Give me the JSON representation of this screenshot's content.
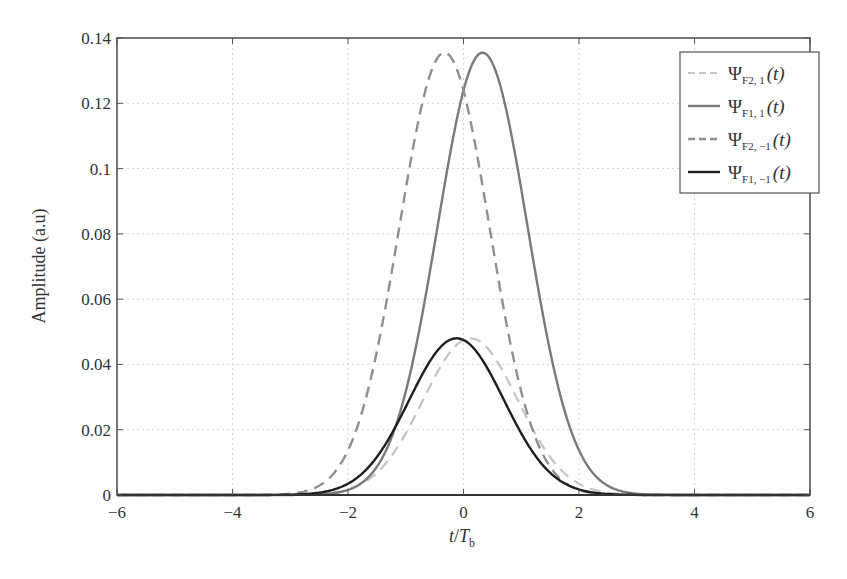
{
  "chart_data": {
    "type": "line",
    "title": "",
    "xlabel": "t/T_b",
    "xlabel_parts": {
      "t": "t",
      "slash": "/",
      "T": "T",
      "sub": "b"
    },
    "ylabel": "Amplitude (a.u)",
    "xlim": [
      -6,
      6
    ],
    "ylim": [
      0,
      0.14
    ],
    "grid": true,
    "legend_position": "upper right",
    "x_ticks": [
      -6,
      -4,
      -2,
      0,
      2,
      4,
      6
    ],
    "x_tick_labels": [
      "−6",
      "−4",
      "−2",
      "0",
      "2",
      "4",
      "6"
    ],
    "y_ticks": [
      0,
      0.02,
      0.04,
      0.06,
      0.08,
      0.1,
      0.12,
      0.14
    ],
    "y_tick_labels": [
      "0",
      "0.02",
      "0.04",
      "0.06",
      "0.08",
      "0.1",
      "0.12",
      "0.14"
    ],
    "series": [
      {
        "name": "ΨF2,1(t)",
        "label_main": "Ψ",
        "label_sub": "F2, 1",
        "label_arg": "(t)",
        "style": "dashed",
        "color": "#c4c4c4",
        "width": 2.2,
        "shape": {
          "peak": 0.048,
          "center": 0.12,
          "sigma": 0.82
        },
        "x": [
          -6,
          -4,
          -3,
          -2,
          -1.5,
          -1,
          -0.5,
          0,
          0.12,
          0.5,
          1,
          1.5,
          2,
          3,
          4,
          6
        ],
        "values": [
          0,
          0,
          0.0007,
          0.0045,
          0.011,
          0.0211,
          0.0335,
          0.0449,
          0.048,
          0.043,
          0.0301,
          0.0162,
          0.0069,
          0.0005,
          0,
          0
        ]
      },
      {
        "name": "ΨF1,1(t)",
        "label_main": "Ψ",
        "label_sub": "F1, 1",
        "label_arg": "(t)",
        "style": "solid",
        "color": "#7a7a7a",
        "width": 2.4,
        "shape": {
          "peak": 0.1355,
          "center": 0.33,
          "sigma": 0.78
        },
        "x": [
          -6,
          -4,
          -3,
          -2,
          -1.5,
          -1,
          -0.5,
          0,
          0.33,
          0.5,
          1,
          1.5,
          2,
          2.5,
          3,
          4,
          6
        ],
        "values": [
          0,
          0,
          0.0003,
          0.0055,
          0.0158,
          0.0317,
          0.075,
          0.124,
          0.1355,
          0.1329,
          0.0939,
          0.0557,
          0.0274,
          0.011,
          0.0039,
          0.0001,
          0
        ]
      },
      {
        "name": "ΨF2,−1(t)",
        "label_main": "Ψ",
        "label_sub": "F2, −1",
        "label_arg": "(t)",
        "style": "dashed",
        "color": "#8f8f8f",
        "width": 2.4,
        "shape": {
          "peak": 0.1355,
          "center": -0.33,
          "sigma": 0.78
        },
        "x": [
          -6,
          -4,
          -3,
          -2.5,
          -2,
          -1.5,
          -1,
          -0.5,
          -0.33,
          0,
          0.5,
          1,
          1.5,
          2,
          3,
          4,
          6
        ],
        "values": [
          0,
          0.0001,
          0.0039,
          0.011,
          0.0274,
          0.0557,
          0.0939,
          0.1329,
          0.1355,
          0.124,
          0.075,
          0.0317,
          0.0158,
          0.0055,
          0.0003,
          0,
          0
        ]
      },
      {
        "name": "ΨF1,−1(t)",
        "label_main": "Ψ",
        "label_sub": "F1, −1",
        "label_arg": "(t)",
        "style": "solid",
        "color": "#1e1e1e",
        "width": 2.4,
        "shape": {
          "peak": 0.048,
          "center": -0.12,
          "sigma": 0.82
        },
        "x": [
          -6,
          -4,
          -3,
          -2,
          -1.5,
          -1,
          -0.5,
          -0.12,
          0,
          0.5,
          1,
          1.5,
          2,
          3,
          4,
          6
        ],
        "values": [
          0,
          0,
          0.0005,
          0.0069,
          0.0162,
          0.0301,
          0.043,
          0.048,
          0.0449,
          0.0335,
          0.0211,
          0.011,
          0.0045,
          0.0007,
          0,
          0
        ]
      }
    ]
  }
}
